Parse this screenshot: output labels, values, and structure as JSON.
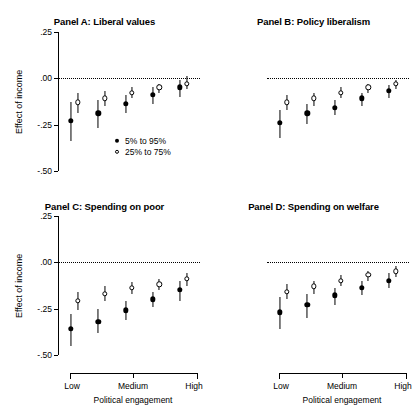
{
  "chart_data": {
    "type": "scatter",
    "title": "",
    "xlabel": "Political engagement",
    "ylabel": "Effect of income",
    "ylim": [
      -0.5,
      0.25
    ],
    "yticks": [
      0.25,
      0.0,
      -0.25,
      -0.5
    ],
    "ytick_labels": [
      ".25",
      ".00",
      "-.25",
      "-.50"
    ],
    "x": [
      1,
      2,
      3,
      4,
      5
    ],
    "xtick_labels": [
      "Low",
      "Medium",
      "High"
    ],
    "grid": false,
    "zero_reference_line": true,
    "legend_position": "panel A lower right",
    "legend": [
      {
        "label": "5% to 95%",
        "marker": "filled-circle"
      },
      {
        "label": "25% to 75%",
        "marker": "open-circle"
      }
    ],
    "panels": [
      {
        "id": "A",
        "title": "Panel A: Liberal values",
        "series": [
          {
            "name": "5% to 95%",
            "marker": "filled-circle",
            "values": [
              -0.23,
              -0.19,
              -0.14,
              -0.09,
              -0.05
            ],
            "lower": [
              -0.34,
              -0.27,
              -0.19,
              -0.14,
              -0.1
            ],
            "upper": [
              -0.13,
              -0.12,
              -0.09,
              -0.05,
              -0.01
            ]
          },
          {
            "name": "25% to 75%",
            "marker": "open-circle",
            "values": [
              -0.13,
              -0.11,
              -0.08,
              -0.05,
              -0.03
            ],
            "lower": [
              -0.19,
              -0.15,
              -0.11,
              -0.08,
              -0.06
            ],
            "upper": [
              -0.08,
              -0.07,
              -0.05,
              -0.03,
              0.01
            ]
          }
        ]
      },
      {
        "id": "B",
        "title": "Panel B: Policy liberalism",
        "series": [
          {
            "name": "5% to 95%",
            "marker": "filled-circle",
            "values": [
              -0.24,
              -0.19,
              -0.16,
              -0.11,
              -0.07
            ],
            "lower": [
              -0.32,
              -0.25,
              -0.2,
              -0.15,
              -0.11
            ],
            "upper": [
              -0.17,
              -0.14,
              -0.12,
              -0.08,
              -0.04
            ]
          },
          {
            "name": "25% to 75%",
            "marker": "open-circle",
            "values": [
              -0.13,
              -0.11,
              -0.08,
              -0.05,
              -0.03
            ],
            "lower": [
              -0.17,
              -0.15,
              -0.11,
              -0.08,
              -0.06
            ],
            "upper": [
              -0.09,
              -0.08,
              -0.05,
              -0.03,
              -0.01
            ]
          }
        ]
      },
      {
        "id": "C",
        "title": "Panel C: Spending on poor",
        "series": [
          {
            "name": "5% to 95%",
            "marker": "filled-circle",
            "values": [
              -0.36,
              -0.32,
              -0.26,
              -0.2,
              -0.15
            ],
            "lower": [
              -0.45,
              -0.38,
              -0.31,
              -0.24,
              -0.21
            ],
            "upper": [
              -0.28,
              -0.25,
              -0.21,
              -0.16,
              -0.1
            ]
          },
          {
            "name": "25% to 75%",
            "marker": "open-circle",
            "values": [
              -0.21,
              -0.17,
              -0.14,
              -0.12,
              -0.09
            ],
            "lower": [
              -0.26,
              -0.21,
              -0.17,
              -0.15,
              -0.13
            ],
            "upper": [
              -0.16,
              -0.13,
              -0.11,
              -0.09,
              -0.06
            ]
          }
        ]
      },
      {
        "id": "D",
        "title": "Panel D: Spending on welfare",
        "series": [
          {
            "name": "5% to 95%",
            "marker": "filled-circle",
            "values": [
              -0.27,
              -0.23,
              -0.18,
              -0.14,
              -0.1
            ],
            "lower": [
              -0.36,
              -0.3,
              -0.23,
              -0.18,
              -0.14
            ],
            "upper": [
              -0.19,
              -0.17,
              -0.14,
              -0.1,
              -0.06
            ]
          },
          {
            "name": "25% to 75%",
            "marker": "open-circle",
            "values": [
              -0.16,
              -0.13,
              -0.1,
              -0.07,
              -0.05
            ],
            "lower": [
              -0.2,
              -0.17,
              -0.13,
              -0.1,
              -0.08
            ],
            "upper": [
              -0.12,
              -0.1,
              -0.07,
              -0.05,
              -0.02
            ]
          }
        ]
      }
    ]
  }
}
